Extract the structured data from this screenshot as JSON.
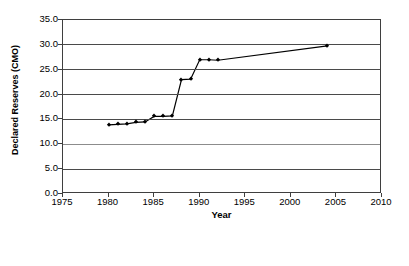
{
  "chart_data": {
    "type": "line",
    "title": "",
    "xlabel": "Year",
    "ylabel": "Declared Reserves (CMO)",
    "xlim": [
      1975,
      2010
    ],
    "ylim": [
      0,
      35
    ],
    "xticks": [
      "1975",
      "1980",
      "1985",
      "1990",
      "1995",
      "2000",
      "2005",
      "2010"
    ],
    "yticks": [
      "0.0",
      "5.0",
      "10.0",
      "15.0",
      "20.0",
      "25.0",
      "30.0",
      "35.0"
    ],
    "grid": true,
    "legend": "none",
    "marker": "diamond",
    "line_color": "#000000",
    "x": [
      1980,
      1981,
      1982,
      1983,
      1984,
      1985,
      1986,
      1987,
      1988,
      1989,
      1990,
      1991,
      1992,
      2004
    ],
    "values": [
      13.9,
      14.0,
      14.1,
      14.4,
      14.5,
      15.6,
      15.6,
      15.7,
      23.0,
      23.1,
      27.0,
      27.0,
      26.9,
      29.8
    ],
    "series": [
      {
        "name": "Declared Reserves",
        "x": [
          1980,
          1981,
          1982,
          1983,
          1984,
          1985,
          1986,
          1987,
          1988,
          1989,
          1990,
          1991,
          1992,
          2004
        ],
        "values": [
          13.9,
          14.0,
          14.1,
          14.4,
          14.5,
          15.6,
          15.6,
          15.7,
          23.0,
          23.1,
          27.0,
          27.0,
          26.9,
          29.8
        ]
      }
    ]
  }
}
